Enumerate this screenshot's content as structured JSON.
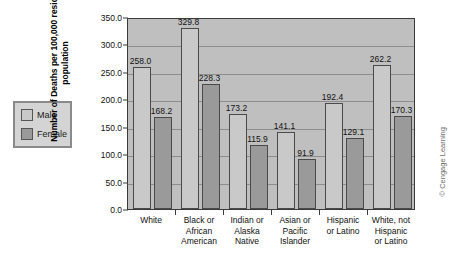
{
  "chart_data": {
    "type": "bar",
    "title": "",
    "xlabel": "",
    "ylabel": "Number of Deaths per 100,000 resident population",
    "ylabel_lines": [
      "Number of Deaths per 100,000 resident",
      "population"
    ],
    "ylim": [
      0,
      350
    ],
    "ytick_labels": [
      "0.0",
      "50.0",
      "100.0",
      "150.0",
      "200.0",
      "250.0",
      "300.0",
      "350.0"
    ],
    "ytick_values": [
      0,
      50,
      100,
      150,
      200,
      250,
      300,
      350
    ],
    "grid": true,
    "legend_position": "outside-left",
    "categories": [
      "White",
      "Black or African American",
      "Indian or Alaska Native",
      "Asian or Pacific Islander",
      "Hispanic or Latino",
      "White, not Hispanic or Latino"
    ],
    "category_lines": [
      [
        "White"
      ],
      [
        "Black or",
        "African",
        "American"
      ],
      [
        "Indian or",
        "Alaska",
        "Native"
      ],
      [
        "Asian or",
        "Pacific",
        "Islander"
      ],
      [
        "Hispanic",
        "or Latino"
      ],
      [
        "White, not",
        "Hispanic",
        "or Latino"
      ]
    ],
    "series": [
      {
        "name": "Male",
        "color": "#c9c9c9",
        "values": [
          258.0,
          329.8,
          173.2,
          141.1,
          192.4,
          262.2
        ],
        "labels": [
          "258.0",
          "329.8",
          "173.2",
          "141.1",
          "192.4",
          "262.2"
        ]
      },
      {
        "name": "Female",
        "color": "#9a9a9a",
        "values": [
          168.2,
          228.3,
          115.9,
          91.9,
          129.1,
          170.3
        ],
        "labels": [
          "168.2",
          "228.3",
          "115.9",
          "91.9",
          "129.1",
          "170.3"
        ]
      }
    ]
  },
  "legend": {
    "items": [
      {
        "label": "Male",
        "swatch": "male"
      },
      {
        "label": "Female",
        "swatch": "female"
      }
    ]
  },
  "credit": {
    "text": "© Cengage Learning"
  }
}
